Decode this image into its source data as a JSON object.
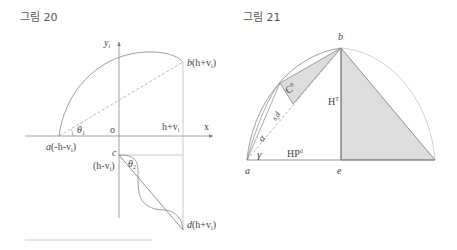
{
  "figures": [
    {
      "title": "그림 20",
      "labels": {
        "y_axis": "y",
        "y_axis_sub": "i",
        "x_axis": "x",
        "origin": "o",
        "theta1": "θ",
        "theta1_sub": "1",
        "theta2": "θ",
        "theta2_sub": "2",
        "point_a": "a",
        "point_a_coord": "(-h-v",
        "point_a_coord_sub": "i",
        "point_a_coord_end": ")",
        "point_b": "b",
        "point_b_coord": "(h+v",
        "point_b_coord_sub": "i",
        "point_b_coord_end": ")",
        "x_tick": "h+v",
        "x_tick_sub": "i",
        "point_c": "c",
        "point_c_coord": "(h-v",
        "point_c_coord_sub": "i",
        "point_c_coord_end": ")",
        "point_d": "d",
        "point_d_coord": "(h+v",
        "point_d_coord_sub": "i",
        "point_d_coord_end": ")"
      }
    },
    {
      "title": "그림 21",
      "labels": {
        "point_a": "a",
        "point_b": "b",
        "point_e": "e",
        "height": "H",
        "height_sup": "T",
        "base": "HP",
        "base_sup": "d",
        "gamma": "γ",
        "alpha": "α",
        "c_theta": "C",
        "c_theta_sup": "θ",
        "sid": "s",
        "sid_sub": "i",
        "sid_end": "d"
      }
    }
  ],
  "colors": {
    "line": "#888888",
    "dark_line": "#666666",
    "shade": "#dddddd",
    "text": "#444444"
  }
}
